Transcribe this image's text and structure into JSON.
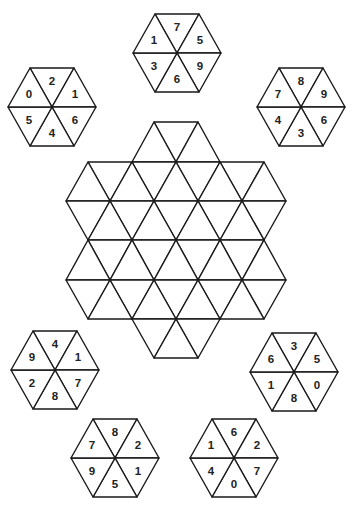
{
  "puzzle": {
    "line_color": "#1a1a1a",
    "background": "#ffffff",
    "board": {
      "center_x": 176,
      "side": 44,
      "rows_y": [
        122,
        162,
        201,
        240,
        280,
        319,
        358
      ],
      "row_extents": [
        [
          154,
          198
        ],
        [
          88,
          264
        ],
        [
          66,
          286
        ],
        [
          88,
          264
        ],
        [
          66,
          286
        ],
        [
          88,
          264
        ],
        [
          154,
          198
        ]
      ]
    },
    "tiles": [
      {
        "name": "tile-top",
        "cx": 177,
        "cy": 53,
        "numbers": {
          "top": "7",
          "upper_right": "5",
          "lower_right": "9",
          "bottom": "6",
          "lower_left": "3",
          "upper_left": "1"
        }
      },
      {
        "name": "tile-upper-left",
        "cx": 52,
        "cy": 107,
        "numbers": {
          "top": "2",
          "upper_right": "1",
          "lower_right": "6",
          "bottom": "4",
          "lower_left": "5",
          "upper_left": "0"
        }
      },
      {
        "name": "tile-upper-right",
        "cx": 301,
        "cy": 107,
        "numbers": {
          "top": "8",
          "upper_right": "9",
          "lower_right": "6",
          "bottom": "3",
          "lower_left": "4",
          "upper_left": "7"
        }
      },
      {
        "name": "tile-middle-left",
        "cx": 55,
        "cy": 370,
        "numbers": {
          "top": "4",
          "upper_right": "1",
          "lower_right": "7",
          "bottom": "8",
          "lower_left": "2",
          "upper_left": "9"
        }
      },
      {
        "name": "tile-middle-right",
        "cx": 294,
        "cy": 372,
        "numbers": {
          "top": "3",
          "upper_right": "5",
          "lower_right": "0",
          "bottom": "8",
          "lower_left": "1",
          "upper_left": "6"
        }
      },
      {
        "name": "tile-bottom-left",
        "cx": 115,
        "cy": 458,
        "numbers": {
          "top": "8",
          "upper_right": "2",
          "lower_right": "1",
          "bottom": "5",
          "lower_left": "9",
          "upper_left": "7"
        }
      },
      {
        "name": "tile-bottom-right",
        "cx": 234,
        "cy": 458,
        "numbers": {
          "top": "6",
          "upper_right": "2",
          "lower_right": "7",
          "bottom": "0",
          "lower_left": "4",
          "upper_left": "1"
        }
      }
    ]
  }
}
